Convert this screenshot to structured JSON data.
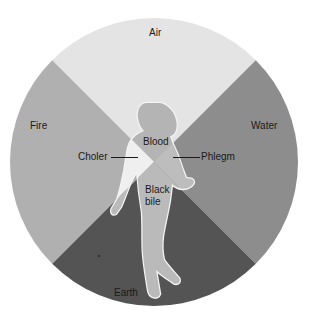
{
  "diagram": {
    "elements": [
      {
        "name": "Air",
        "position": "top",
        "color": "#e4e4e4",
        "figure_color": "#b4b4b4"
      },
      {
        "name": "Fire",
        "position": "left",
        "color": "#b0b0b0",
        "figure_color": "#efefef"
      },
      {
        "name": "Water",
        "position": "right",
        "color": "#8d8d8d",
        "figure_color": "#bdbdbd"
      },
      {
        "name": "Earth",
        "position": "bottom",
        "color": "#545454",
        "figure_color": "#bababa"
      }
    ],
    "humours": {
      "blood": "Blood",
      "choler": "Choler",
      "phlegm": "Phlegm",
      "black_bile_line1": "Black",
      "black_bile_line2": "bile"
    },
    "labels": {
      "air": "Air",
      "fire": "Fire",
      "water": "Water",
      "earth": "Earth"
    }
  }
}
